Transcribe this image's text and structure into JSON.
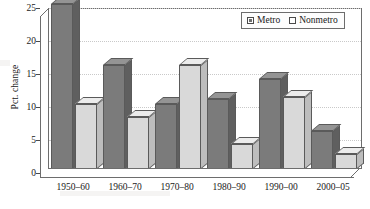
{
  "chart_data": {
    "type": "bar",
    "title": "",
    "xlabel": "",
    "ylabel": "Pct. change",
    "ylim": [
      0,
      25
    ],
    "yticks": [
      0,
      5,
      10,
      15,
      20,
      25
    ],
    "grid": true,
    "legend_position": "top-right",
    "categories": [
      "1950–60",
      "1960–70",
      "1970–80",
      "1980–90",
      "1990–00",
      "2000–05"
    ],
    "series": [
      {
        "name": "Metro",
        "color": "#7b7b7b",
        "values": [
          25.0,
          15.7,
          9.8,
          10.6,
          13.6,
          5.7
        ]
      },
      {
        "name": "Nonmetro",
        "color": "#d9d9d9",
        "values": [
          9.9,
          7.9,
          15.7,
          3.8,
          10.9,
          2.2
        ]
      }
    ]
  },
  "legend": {
    "entries": [
      {
        "label": "Metro",
        "swatch": "filled-square-icon"
      },
      {
        "label": "Nonmetro",
        "swatch": "hollow-square-icon"
      }
    ]
  },
  "axes": {
    "y_label": "Pct. change",
    "y_tick_labels": [
      "25",
      "20",
      "15",
      "10",
      "5",
      "0"
    ],
    "x_tick_labels": [
      "1950–60",
      "1960–70",
      "1970–80",
      "1980–90",
      "1990–00",
      "2000–05"
    ]
  }
}
